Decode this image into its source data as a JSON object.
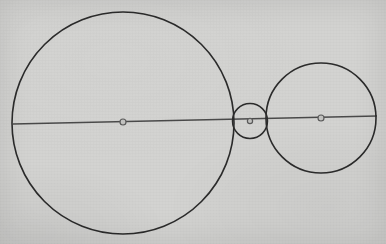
{
  "figure": {
    "width": 386,
    "height": 244,
    "background_color": "#d3d3d1",
    "stroke_color": "#2b2b2b",
    "line_color": "#4a4a4a",
    "marker_fill_color": "#c3c3c1",
    "marker_stroke_color": "#5a5a5a"
  },
  "chart_data": {
    "type": "scatter",
    "xlabel": "",
    "ylabel": "",
    "xlim": [
      0,
      386
    ],
    "ylim": [
      0,
      244
    ],
    "grid": false,
    "legend": "none",
    "circles": [
      {
        "name": "large-circle",
        "cx": 123,
        "cy": 123,
        "r": 111,
        "stroke_width": 1.6
      },
      {
        "name": "small-circle",
        "cx": 250,
        "cy": 121,
        "r": 17.5,
        "stroke_width": 1.5
      },
      {
        "name": "medium-circle",
        "cx": 321,
        "cy": 118,
        "r": 55,
        "stroke_width": 1.6
      }
    ],
    "axis_line": {
      "name": "diameter-line",
      "x1": 13,
      "y1": 124,
      "x2": 377,
      "y2": 116,
      "stroke_width": 1.5
    },
    "center_markers": [
      {
        "name": "large-circle-center",
        "cx": 123,
        "cy": 122,
        "r": 3.0
      },
      {
        "name": "small-circle-center",
        "cx": 250,
        "cy": 121,
        "r": 2.6
      },
      {
        "name": "medium-circle-center",
        "cx": 321,
        "cy": 118,
        "r": 3.0
      }
    ]
  }
}
